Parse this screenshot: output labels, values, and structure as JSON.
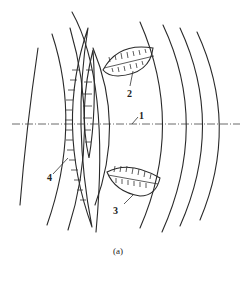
{
  "figure": {
    "caption": "(a)",
    "labels": [
      {
        "id": "1",
        "text": "1",
        "x": 141,
        "y": 119
      },
      {
        "id": "2",
        "text": "2",
        "x": 127,
        "y": 96
      },
      {
        "id": "3",
        "text": "3",
        "x": 114,
        "y": 214
      },
      {
        "id": "4",
        "text": "4",
        "x": 47,
        "y": 181
      }
    ]
  }
}
